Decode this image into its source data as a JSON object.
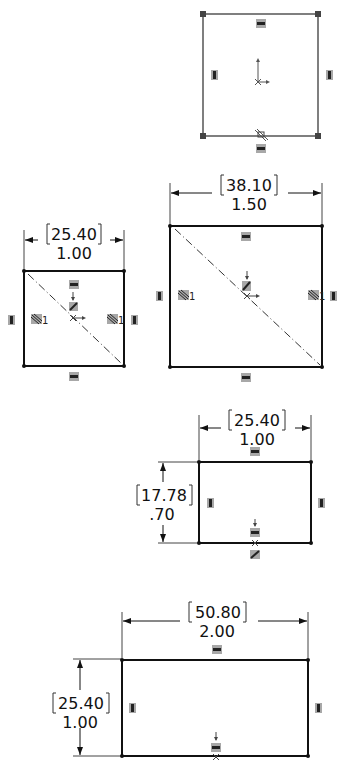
{
  "sketches": [
    {
      "id": "sketch-1",
      "description": "Square with corner points, origin at center, coincident relation at bottom midpoint"
    },
    {
      "id": "sketch-2",
      "width_mm": "25.40",
      "width_in": "1.00",
      "relation_label_left": "1",
      "relation_label_right": "1"
    },
    {
      "id": "sketch-3",
      "width_mm": "38.10",
      "width_in": "1.50",
      "relation_label_left": "1",
      "relation_label_right": "1"
    },
    {
      "id": "sketch-4",
      "width_mm": "25.40",
      "width_in": "1.00",
      "height_mm": "17.78",
      "height_in": ".70"
    },
    {
      "id": "sketch-5",
      "width_mm": "50.80",
      "width_in": "2.00",
      "height_mm": "25.40",
      "height_in": "1.00"
    }
  ],
  "colors": {
    "line": "#1a1a1a",
    "relation_badge": "#a8a8a8",
    "badge_glyph": "#222222"
  }
}
